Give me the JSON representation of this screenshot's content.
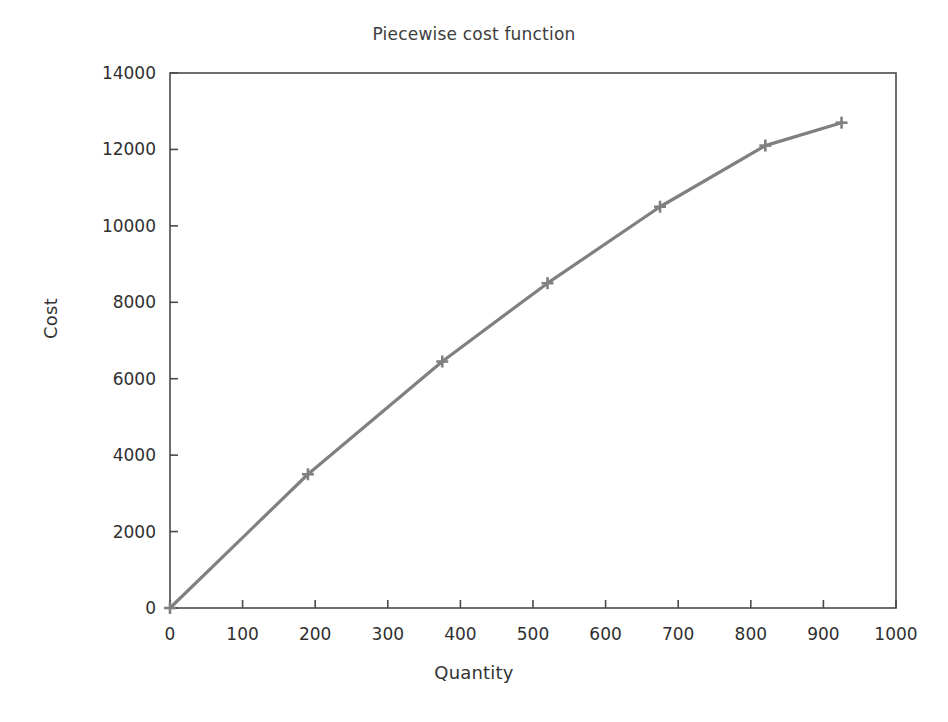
{
  "chart_data": {
    "type": "line",
    "title": "Piecewise cost function",
    "xlabel": "Quantity",
    "ylabel": "Cost",
    "xlim": [
      0,
      1000
    ],
    "ylim": [
      0,
      14000
    ],
    "xticks": [
      0,
      100,
      200,
      300,
      400,
      500,
      600,
      700,
      800,
      900,
      1000
    ],
    "yticks": [
      0,
      2000,
      4000,
      6000,
      8000,
      10000,
      12000,
      14000
    ],
    "xtick_labels": [
      "0",
      "100",
      "200",
      "300",
      "400",
      "500",
      "600",
      "700",
      "800",
      "900",
      "1000"
    ],
    "ytick_labels": [
      "0",
      "2000",
      "4000",
      "6000",
      "8000",
      "10000",
      "12000",
      "14000"
    ],
    "grid": false,
    "legend": false,
    "marker": "plus",
    "line_color": "#808080",
    "marker_color": "#808080",
    "axis_color": "#4a4a4a",
    "background_color": "#ffffff",
    "series": [
      {
        "name": "Cost",
        "x": [
          0,
          190,
          375,
          520,
          675,
          820,
          925
        ],
        "y": [
          0,
          3500,
          6450,
          8500,
          10500,
          12100,
          12700
        ]
      }
    ]
  }
}
